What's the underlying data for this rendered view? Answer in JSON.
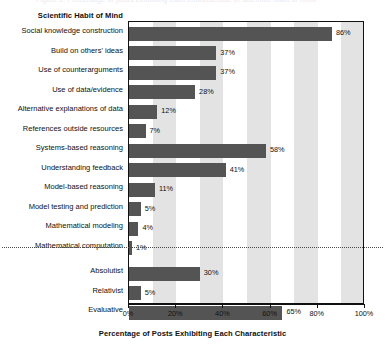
{
  "figure": {
    "group_title": "Scientific Habit of Mind",
    "top_clipped_caption": "Figure 2. Percentage of posts exhibiting each characteristic of scientific habit of mind"
  },
  "chart_data": {
    "type": "bar",
    "orientation": "horizontal",
    "title": "Scientific Habit of Mind",
    "xlabel": "Percentage of Posts Exhibiting Each Characteristic",
    "ylabel": "",
    "xlim": [
      0,
      100
    ],
    "grid": false,
    "legend": null,
    "value_suffix": "%",
    "tick_labels": [
      "0%",
      "20%",
      "40%",
      "60%",
      "80%",
      "100%"
    ],
    "ticks": [
      0,
      20,
      40,
      60,
      80,
      100
    ],
    "banded_background": true,
    "bar_color": "#545454",
    "band_color": "#e3e3e3",
    "categories": [
      "Social knowledge construction",
      "Build on others' ideas",
      "Use of counterarguments",
      "Use of data/evidence",
      "Alternative explanations of data",
      "References outside resources",
      "Systems-based reasoning",
      "Understanding feedback",
      "Model-based reasoning",
      "Model testing and prediction",
      "Mathematical modeling",
      "Mathematical computation",
      "Absolutist",
      "Relativist",
      "Evaluative"
    ],
    "values": [
      86,
      37,
      37,
      28,
      12,
      7,
      58,
      41,
      11,
      5,
      4,
      1,
      30,
      5,
      65
    ],
    "value_labels": [
      "86%",
      "37%",
      "37%",
      "28%",
      "12%",
      "7%",
      "58%",
      "41%",
      "11%",
      "5%",
      "4%",
      "1%",
      "30%",
      "5%",
      "65%"
    ],
    "group_separator_after_index": 11
  }
}
